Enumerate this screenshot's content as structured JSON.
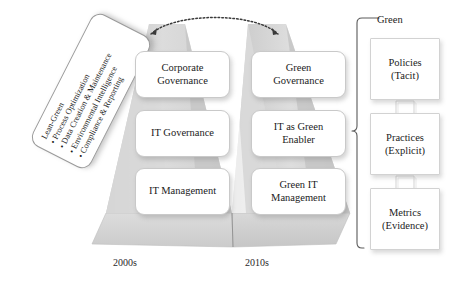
{
  "diagram": {
    "lean_green": {
      "heading": "Lean-Green",
      "bullets": [
        "Process Optimization",
        "Data Creation & Maintenance",
        "Environmental Intelligence",
        "Compliance & Reporting"
      ]
    },
    "columns": [
      {
        "era_label": "2000s",
        "boxes": [
          {
            "label": "Corporate Governance",
            "lines": [
              "Corporate",
              "Governance"
            ]
          },
          {
            "label": "IT Governance",
            "lines": [
              "IT Governance"
            ]
          },
          {
            "label": "IT Management",
            "lines": [
              "IT Management"
            ]
          }
        ]
      },
      {
        "era_label": "2010s",
        "boxes": [
          {
            "label": "Green Governance",
            "lines": [
              "Green",
              "Governance"
            ]
          },
          {
            "label": "IT as Green Enabler",
            "lines": [
              "IT as Green",
              "Enabler"
            ]
          },
          {
            "label": "Green IT Management",
            "lines": [
              "Green IT",
              "Management"
            ]
          }
        ]
      }
    ],
    "arc": {
      "style": "dotted",
      "double_headed": true
    },
    "green_panel": {
      "bracket_label": "Green",
      "boxes": [
        {
          "title": "Policies",
          "subtitle": "(Tacit)"
        },
        {
          "title": "Practices",
          "subtitle": "(Explicit)"
        },
        {
          "title": "Metrics",
          "subtitle": "(Evidence)"
        }
      ],
      "arrow_direction": "down"
    },
    "colors": {
      "pyramid_fill": "#d8d8d8",
      "pyramid_side": "#c4c4c4",
      "base_fill": "#d0d0d0",
      "box_border": "#c9c9c9",
      "text": "#1b1b1b",
      "background": "#ffffff"
    }
  }
}
